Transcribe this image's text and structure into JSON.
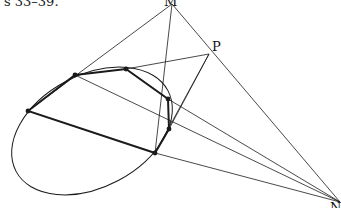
{
  "caption": "s 33–39.",
  "labels": {
    "M": "M",
    "P": "P",
    "N": "N"
  },
  "points": {
    "M": [
      172,
      4
    ],
    "P": [
      209,
      54
    ],
    "N": [
      340,
      202
    ],
    "A": [
      28,
      111
    ],
    "B": [
      75,
      75
    ],
    "C": [
      126,
      69
    ],
    "D": [
      168,
      99
    ],
    "E": [
      169,
      129
    ],
    "F": [
      155,
      153
    ]
  },
  "ellipse": {
    "cx": 92,
    "cy": 131,
    "rx": 86,
    "ry": 56,
    "rotate": -28
  },
  "colors": {
    "stroke": "#1a1a1a"
  }
}
